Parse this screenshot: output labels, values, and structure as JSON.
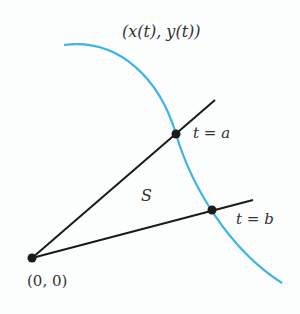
{
  "diagram": {
    "curve_label": "(x(t), y(t))",
    "region_label": "S",
    "point_a_label": "t = a",
    "point_b_label": "t = b",
    "origin_label": "(0, 0)",
    "colors": {
      "curve": "#3cb4e6",
      "lines": "#1a1a1a",
      "text": "#333333",
      "background": "#fcfdfd"
    },
    "points": {
      "origin": [
        32,
        258
      ],
      "a": [
        176,
        134
      ],
      "b": [
        212,
        210
      ]
    }
  }
}
